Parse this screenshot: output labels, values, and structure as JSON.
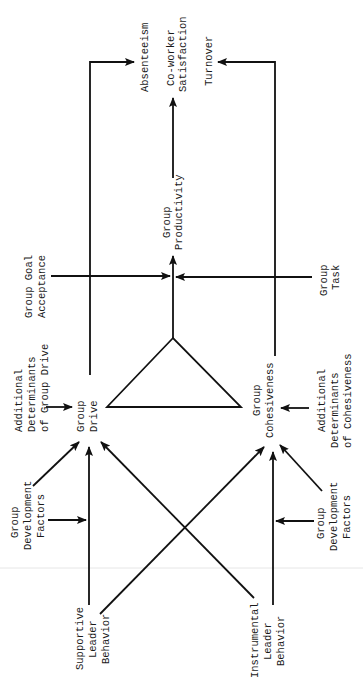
{
  "diagram": {
    "orientation": "rotated-90-ccw",
    "nodes": {
      "absenteeism": [
        "Absenteeism"
      ],
      "coworker_satisfaction": [
        "Co-worker",
        "Satisfaction"
      ],
      "turnover": [
        "Turnover"
      ],
      "group_productivity": [
        "Group",
        "Productivity"
      ],
      "group_goal_acceptance": [
        "Group Goal",
        "Acceptance"
      ],
      "group_task": [
        "Group",
        "Task"
      ],
      "additional_determinants_drive": [
        "Additional",
        "Determinants",
        "of Group Drive"
      ],
      "group_drive": [
        "Group",
        "Drive"
      ],
      "group_cohesiveness": [
        "Group",
        "Cohesiveness"
      ],
      "additional_determinants_cohesiveness": [
        "Additional",
        "Determinants",
        "of Cohesiveness"
      ],
      "group_development_factors_left": [
        "Group",
        "Development",
        "Factors"
      ],
      "group_development_factors_right": [
        "Group",
        "Development",
        "Factors"
      ],
      "supportive_leader_behavior": [
        "Supportive",
        "Leader",
        "Behavior"
      ],
      "instrumental_leader_behavior": [
        "Instrumental",
        "Leader",
        "Behavior"
      ]
    },
    "edges": [
      {
        "from": "Supportive Leader Behavior",
        "to": "Group Drive"
      },
      {
        "from": "Supportive Leader Behavior",
        "to": "Group Cohesiveness"
      },
      {
        "from": "Instrumental Leader Behavior",
        "to": "Group Drive"
      },
      {
        "from": "Instrumental Leader Behavior",
        "to": "Group Cohesiveness"
      },
      {
        "from": "Group Development Factors",
        "to": "Group Drive"
      },
      {
        "from": "Group Development Factors",
        "to": "Supportive Leader Behavior → Group Drive link"
      },
      {
        "from": "Group Development Factors",
        "to": "Group Cohesiveness"
      },
      {
        "from": "Group Development Factors",
        "to": "Instrumental Leader Behavior → Group Cohesiveness link"
      },
      {
        "from": "Additional Determinants of Group Drive",
        "to": "Group Drive"
      },
      {
        "from": "Additional Determinants of Cohesiveness",
        "to": "Group Cohesiveness"
      },
      {
        "from": "Group Drive + Group Cohesiveness",
        "to": "Group Productivity"
      },
      {
        "from": "Group Goal Acceptance",
        "to": "Group Productivity link"
      },
      {
        "from": "Group Task",
        "to": "Group Productivity link"
      },
      {
        "from": "Group Productivity",
        "to": "Co-worker Satisfaction"
      },
      {
        "from": "Group Drive",
        "to": "Absenteeism"
      },
      {
        "from": "Group Cohesiveness",
        "to": "Turnover"
      }
    ]
  }
}
